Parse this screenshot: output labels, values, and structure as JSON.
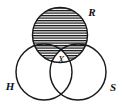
{
  "figure": {
    "kind": "three-set-venn-diagram",
    "background_color": "#ffffff",
    "stroke_color": "#1a1a1a",
    "hatch_color": "#111111",
    "hatch_pattern": "horizontal-lines",
    "hatch_spacing_px": 2.5
  },
  "sets": [
    {
      "id": "R",
      "label": "R",
      "label_x": 92,
      "label_y": 13,
      "cx": 60.0,
      "cy": 35.0,
      "r": 27.5,
      "shaded": true
    },
    {
      "id": "H",
      "label": "H",
      "label_x": 10,
      "label_y": 87,
      "cx": 44.0,
      "cy": 72.0,
      "r": 28.0,
      "shaded": false
    },
    {
      "id": "S",
      "label": "S",
      "label_x": 113,
      "label_y": 88,
      "cx": 78.0,
      "cy": 72.0,
      "r": 28.0,
      "shaded": false
    }
  ],
  "regions": [
    {
      "id": "X",
      "label": "X",
      "label_x": 61,
      "label_y": 61,
      "description": "triple intersection R and H and S, left unshaded",
      "shaded": false
    }
  ]
}
